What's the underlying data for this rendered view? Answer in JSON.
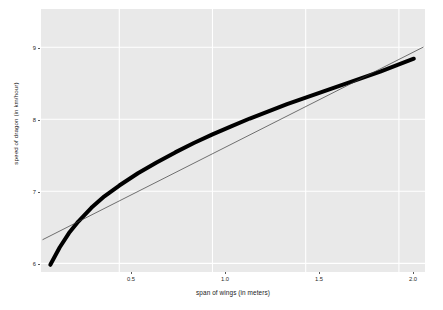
{
  "chart_data": {
    "type": "line",
    "title": "",
    "subtitle": "",
    "xlabel": "span of wings (in meters)",
    "ylabel": "speed of dragon (in km/hour)",
    "xlim": [
      0.08,
      2.14
    ],
    "ylim": [
      5.88,
      9.53
    ],
    "xticks": [
      0.5,
      1.0,
      1.5,
      2.0
    ],
    "xtick_labels": [
      "0.5",
      "1.0",
      "1.5",
      "2.0"
    ],
    "yticks": [
      6,
      7,
      8,
      9
    ],
    "ytick_labels": [
      "6",
      "7",
      "8",
      "9"
    ],
    "grid": true,
    "grid_color": "#ffffff",
    "panel_background": "#e9e9e9",
    "figure_background": "#ffffff",
    "legend": null,
    "series": [
      {
        "name": "fitted curve",
        "style": "thick-curve",
        "color": "#000000",
        "linewidth": 4,
        "x": [
          0.13,
          0.18,
          0.23,
          0.28,
          0.35,
          0.42,
          0.5,
          0.6,
          0.7,
          0.8,
          0.9,
          1.0,
          1.1,
          1.2,
          1.3,
          1.4,
          1.5,
          1.6,
          1.7,
          1.8,
          1.9,
          2.0,
          2.08
        ],
        "y": [
          5.98,
          6.22,
          6.42,
          6.58,
          6.77,
          6.93,
          7.08,
          7.25,
          7.4,
          7.54,
          7.67,
          7.79,
          7.9,
          8.01,
          8.11,
          8.21,
          8.3,
          8.39,
          8.48,
          8.57,
          8.66,
          8.76,
          8.84
        ]
      },
      {
        "name": "linear fit",
        "style": "thin-line",
        "color": "#3a3a3a",
        "linewidth": 0.7,
        "x": [
          0.09,
          2.13
        ],
        "y": [
          6.33,
          9.0
        ]
      }
    ]
  },
  "axis": {
    "y_title": "speed of dragon (in km/hour)",
    "x_title": "span of wings (in meters)",
    "y_tick_labels": [
      "9",
      "8",
      "7",
      "6"
    ],
    "x_tick_labels": [
      "0.5",
      "1.0",
      "1.5",
      "2.0"
    ]
  }
}
